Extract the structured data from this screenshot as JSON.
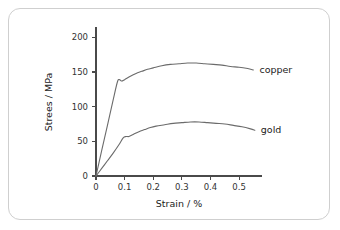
{
  "chart_data": {
    "type": "line",
    "title": "",
    "xlabel": "Strain / %",
    "ylabel": "Strees / MPa",
    "xlim": [
      0,
      0.58
    ],
    "ylim": [
      0,
      215
    ],
    "grid": false,
    "legend_position": "right-inline",
    "xticks": [
      "0",
      "0.1",
      "0.2",
      "0.3",
      "0.4",
      "0.5"
    ],
    "xtick_values": [
      0,
      0.1,
      0.2,
      0.3,
      0.4,
      0.5
    ],
    "yticks": [
      "0",
      "50",
      "100",
      "150",
      "200"
    ],
    "ytick_values": [
      0,
      50,
      100,
      150,
      200
    ],
    "series": [
      {
        "name": "copper",
        "label": "copper",
        "color": "#6b6b6b",
        "x": [
          0,
          0.02,
          0.04,
          0.06,
          0.075,
          0.082,
          0.09,
          0.1,
          0.12,
          0.14,
          0.16,
          0.18,
          0.2,
          0.23,
          0.26,
          0.29,
          0.32,
          0.35,
          0.38,
          0.41,
          0.44,
          0.47,
          0.5,
          0.53,
          0.55
        ],
        "y": [
          0,
          37,
          73,
          110,
          136,
          139,
          137,
          139,
          144,
          148,
          151,
          154,
          156,
          159,
          161,
          162,
          163,
          163,
          162,
          161,
          160,
          158,
          157,
          155,
          153
        ]
      },
      {
        "name": "gold",
        "label": "gold",
        "color": "#6b6b6b",
        "x": [
          0,
          0.02,
          0.04,
          0.06,
          0.08,
          0.095,
          0.105,
          0.115,
          0.13,
          0.15,
          0.17,
          0.19,
          0.21,
          0.24,
          0.27,
          0.3,
          0.33,
          0.36,
          0.39,
          0.42,
          0.45,
          0.48,
          0.51,
          0.54,
          0.555
        ],
        "y": [
          0,
          11,
          22,
          33,
          45,
          55,
          57,
          57,
          60,
          64,
          67,
          70,
          72,
          74,
          76,
          77,
          78,
          78,
          77,
          76,
          75,
          73,
          71,
          68,
          66
        ]
      }
    ]
  },
  "figure": {
    "border_color": "#cfcfcf",
    "background_color": "#ffffff",
    "axis_color": "#4a4a4a",
    "text_color": "#222222"
  }
}
